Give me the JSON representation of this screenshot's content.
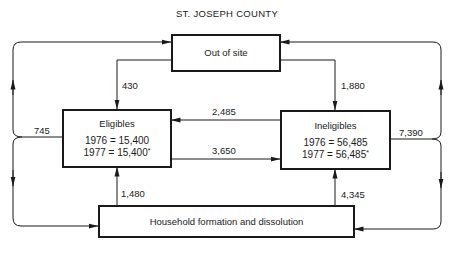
{
  "title": "ST. JOSEPH COUNTY",
  "nodes": {
    "out_of_site": {
      "label": "Out of site"
    },
    "eligibles": {
      "label": "Eligibles",
      "line_1976": "1976 = 15,400",
      "line_1977": "1977 = 15,400",
      "asterisk": "*"
    },
    "ineligibles": {
      "label": "Ineligibles",
      "line_1976": "1976 = 56,485",
      "line_1977": "1977 = 56,485",
      "asterisk": "*"
    },
    "household": {
      "label": "Household formation and dissolution"
    }
  },
  "flows": {
    "out_to_eligibles": "430",
    "out_to_ineligibles": "1,880",
    "ineligibles_to_eligibles": "2,485",
    "eligibles_to_ineligibles": "3,650",
    "household_to_eligibles": "1,480",
    "household_to_ineligibles": "4,345",
    "eligibles_outflow": "745",
    "ineligibles_outflow": "7,390"
  },
  "colors": {
    "ink": "#1a1a1a",
    "background": "#ffffff"
  }
}
